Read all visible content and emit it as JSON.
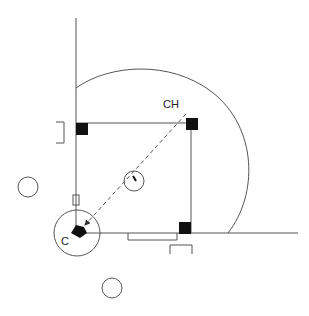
{
  "diagram": {
    "type": "baseball-field-position-diagram",
    "labels": {
      "catcher": "C",
      "target": "CH"
    },
    "colors": {
      "line": "#555555",
      "base": "#111111",
      "background": "#ffffff"
    },
    "elements": {
      "bases": [
        "home-plate",
        "first-base",
        "second-base",
        "third-base"
      ],
      "circles": [
        "pitcher-mound",
        "home-circle",
        "on-deck-circle-left",
        "on-deck-circle-bottom"
      ],
      "boxes": [
        "third-base-coach-box",
        "first-base-coach-box",
        "dugout-bench",
        "line-marker"
      ],
      "throw": {
        "from": "CH",
        "to": "C",
        "style": "dashed-arrow"
      }
    }
  }
}
